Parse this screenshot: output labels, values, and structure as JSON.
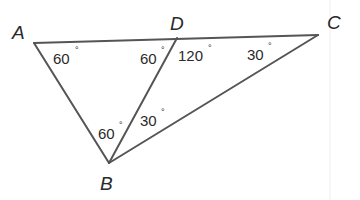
{
  "figure": {
    "type": "triangle-geometry",
    "vertices": [
      {
        "id": "A",
        "label": "A",
        "x": 34,
        "y": 43
      },
      {
        "id": "D",
        "label": "D",
        "x": 177,
        "y": 38
      },
      {
        "id": "C",
        "label": "C",
        "x": 318,
        "y": 35
      },
      {
        "id": "B",
        "label": "B",
        "x": 109,
        "y": 163
      }
    ],
    "segments": [
      [
        "A",
        "C"
      ],
      [
        "A",
        "B"
      ],
      [
        "B",
        "C"
      ],
      [
        "B",
        "D"
      ]
    ],
    "angles": {
      "A": "60",
      "ADB": "60",
      "BDC": "120",
      "C": "30",
      "ABD": "60",
      "DBC": "30"
    },
    "degree_symbol": "°",
    "colors": {
      "stroke": "#555555",
      "text": "#2a2a2a",
      "background": "#ffffff"
    }
  }
}
